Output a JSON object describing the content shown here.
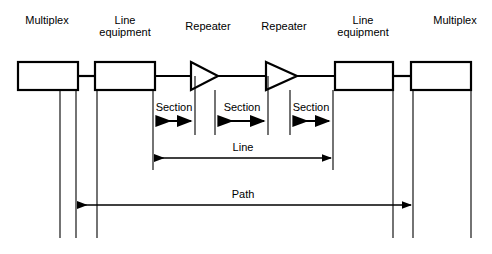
{
  "diagram": {
    "background_color": "#ffffff",
    "line_color": "#000000",
    "nodes": [
      {
        "id": "multiplex-left",
        "label": "Multiplex",
        "type": "box",
        "cx": 47
      },
      {
        "id": "line-equipment-left",
        "label": "Line\nequipment",
        "type": "box",
        "cx": 125
      },
      {
        "id": "repeater-left",
        "label": "Repeater",
        "type": "repeater",
        "cx": 208
      },
      {
        "id": "repeater-right",
        "label": "Repeater",
        "type": "repeater",
        "cx": 284
      },
      {
        "id": "line-equipment-right",
        "label": "Line\nequipment",
        "type": "box",
        "cx": 363
      },
      {
        "id": "multiplex-right",
        "label": "Multiplex",
        "type": "box",
        "cx": 455
      }
    ],
    "spans": [
      {
        "id": "section-1",
        "label": "Section",
        "cx": 174,
        "label_y": 101,
        "arrow_y": 121
      },
      {
        "id": "section-2",
        "label": "Section",
        "cx": 242,
        "label_y": 101,
        "arrow_y": 121
      },
      {
        "id": "section-3",
        "label": "Section",
        "cx": 311,
        "label_y": 101,
        "arrow_y": 121
      },
      {
        "id": "line",
        "label": "Line",
        "cx": 243,
        "label_y": 141,
        "arrow_y": 158
      },
      {
        "id": "path",
        "label": "Path",
        "cx": 243,
        "label_y": 188,
        "arrow_y": 205
      }
    ]
  }
}
